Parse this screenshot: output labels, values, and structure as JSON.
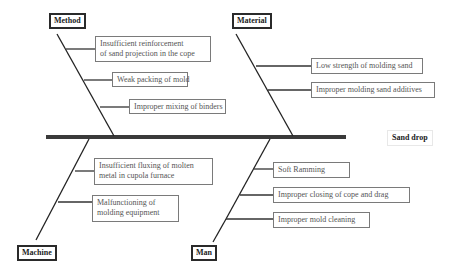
{
  "diagram": {
    "type": "fishbone",
    "effect": "Sand drop",
    "categories": [
      {
        "name": "Method",
        "position": "top-left",
        "causes": [
          "Insufficient reinforcement of sand projection in the cope",
          "Weak packing of mold",
          "Improper mixing of binders"
        ]
      },
      {
        "name": "Material",
        "position": "top-right",
        "causes": [
          "Low strength of molding sand",
          "Improper molding sand additives"
        ]
      },
      {
        "name": "Machine",
        "position": "bottom-left",
        "causes": [
          "Insufficient fluxing of molten metal  in cupola furnace",
          "Malfunctioning of molding equipment"
        ]
      },
      {
        "name": "Man",
        "position": "bottom-right",
        "causes": [
          "Soft Ramming",
          "Improper closing of cope and drag",
          "Improper mold cleaning"
        ]
      }
    ]
  },
  "labels": {
    "effect": "Sand drop",
    "method": "Method",
    "material": "Material",
    "machine": "Machine",
    "man": "Man",
    "method_c1_l1": "Insufficient reinforcement",
    "method_c1_l2": "of sand projection in the cope",
    "method_c2": "Weak packing of mold",
    "method_c3": "Improper mixing of binders",
    "material_c1": "Low strength of molding sand",
    "material_c2": "Improper molding sand additives",
    "machine_c1_l1": "Insufficient fluxing of molten",
    "machine_c1_l2": "metal  in cupola furnace",
    "machine_c2_l1": "Malfunctioning of",
    "machine_c2_l2": "molding equipment",
    "man_c1": "Soft Ramming",
    "man_c2": "Improper closing of cope and drag",
    "man_c3": "Improper mold cleaning"
  },
  "colors": {
    "spine": "#3a3a3a",
    "bone": "#222222",
    "box_border": "#7a7a7a",
    "text": "#555555"
  }
}
